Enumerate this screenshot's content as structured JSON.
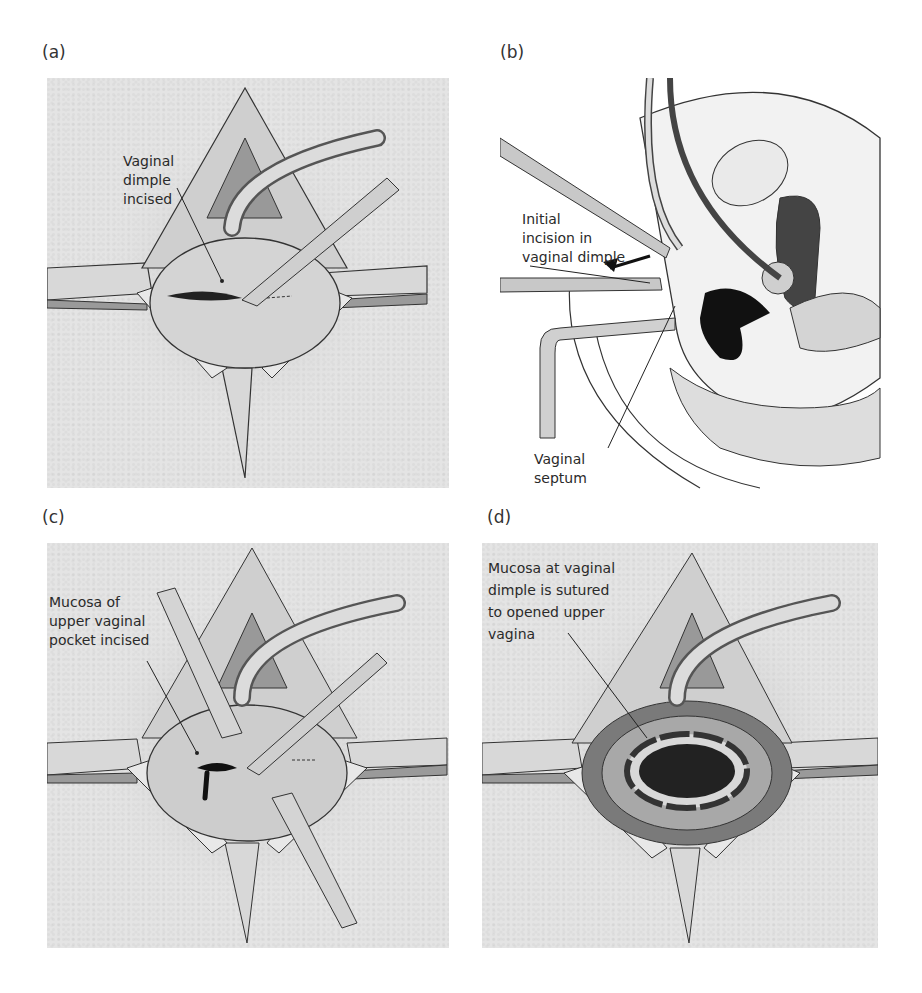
{
  "figure": {
    "panels": [
      {
        "id": "a",
        "label": "(a)",
        "caption_lines": [
          "Vaginal",
          "dimple",
          "incised"
        ]
      },
      {
        "id": "b",
        "label": "(b)",
        "caption_top_lines": [
          "Initial",
          "incision in",
          "vaginal dimple"
        ],
        "caption_bottom_lines": [
          "Vaginal",
          "septum"
        ]
      },
      {
        "id": "c",
        "label": "(c)",
        "caption_lines": [
          "Mucosa of",
          "upper vaginal",
          "pocket incised"
        ]
      },
      {
        "id": "d",
        "label": "(d)",
        "caption_lines": [
          "Mucosa at vaginal",
          "dimple is sutured",
          "to opened upper",
          "vagina"
        ]
      }
    ]
  }
}
